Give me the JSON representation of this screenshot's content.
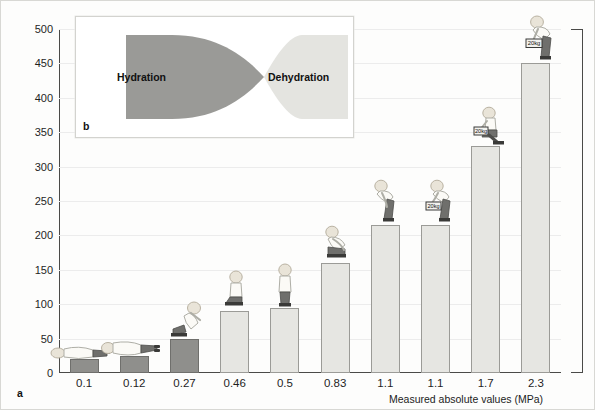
{
  "figure": {
    "panel_a_label": "a",
    "panel_b_label": "b"
  },
  "chart_data": {
    "type": "bar",
    "title": "",
    "xlabel": "Measured absolute values (MPa)",
    "ylabel": "Intradiscal pressure (%)",
    "categories": [
      "0.1",
      "0.12",
      "0.27",
      "0.46",
      "0.5",
      "0.83",
      "1.1",
      "1.1",
      "1.7",
      "2.3"
    ],
    "values": [
      20,
      25,
      50,
      90,
      95,
      160,
      215,
      215,
      330,
      450
    ],
    "ylim": [
      0,
      500
    ],
    "yticks": [
      0,
      50,
      100,
      150,
      200,
      250,
      300,
      350,
      400,
      450,
      500
    ],
    "ytick_labels": [
      "0",
      "50",
      "100",
      "150",
      "200",
      "250",
      "300",
      "350",
      "400",
      "450",
      "500"
    ],
    "grid": true,
    "legend": "none",
    "bar_colors": [
      "#8f8f8c",
      "#8f8f8c",
      "#8f8f8c",
      "#e6e6e2",
      "#e6e6e2",
      "#e6e6e2",
      "#e6e6e2",
      "#e6e6e2",
      "#e6e6e2",
      "#e6e6e2"
    ],
    "annotations": [
      {
        "category": "0.1",
        "posture": "lying-supine"
      },
      {
        "category": "0.12",
        "posture": "lying-on-side"
      },
      {
        "category": "0.27",
        "posture": "reclined-seated"
      },
      {
        "category": "0.46",
        "posture": "seated-upright"
      },
      {
        "category": "0.5",
        "posture": "standing-upright"
      },
      {
        "category": "0.83",
        "posture": "seated-leaning-forward"
      },
      {
        "category": "1.1",
        "posture": "standing-bent-forward"
      },
      {
        "category": "1.1",
        "posture": "standing-bent-forward-with-weight",
        "weight_label": "20kg"
      },
      {
        "category": "1.7",
        "posture": "seated-bent-forward-with-weight",
        "weight_label": "20kg"
      },
      {
        "category": "2.3",
        "posture": "standing-bent-forward-lifting-weight",
        "weight_label": "20kg"
      }
    ]
  },
  "panel_b": {
    "left_label": "Hydration",
    "right_label": "Dehydration",
    "left_color": "#9a9a97",
    "right_color": "#e4e4e0"
  },
  "colors": {
    "bar_light": "#e6e6e2",
    "bar_dark": "#8f8f8c",
    "axis": "#4a4a48",
    "grid": "#ececec",
    "background": "#fdfdfc",
    "text": "#1f1f1f"
  }
}
